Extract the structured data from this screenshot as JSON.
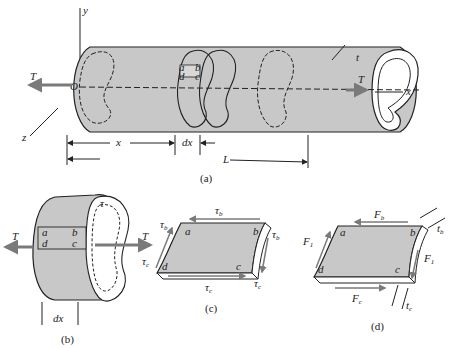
{
  "figure": {
    "panels": [
      {
        "id": "a",
        "caption": "(a)"
      },
      {
        "id": "b",
        "caption": "(b)"
      },
      {
        "id": "c",
        "caption": "(c)"
      },
      {
        "id": "d",
        "caption": "(d)"
      }
    ]
  },
  "panel_a": {
    "axis_y": "y",
    "axis_x": "x",
    "axis_z": "z",
    "origin": "O",
    "torque_left": "T",
    "torque_right": "T",
    "thickness": "t",
    "dim_x": "x",
    "dim_dx": "dx",
    "dim_L": "L",
    "corners": [
      "a",
      "b",
      "c",
      "d"
    ]
  },
  "panel_b": {
    "torque_left": "T",
    "torque_right": "T",
    "shear": "τ",
    "corners": [
      "a",
      "b",
      "c",
      "d"
    ],
    "dim_dx": "dx"
  },
  "panel_c": {
    "tau_b": "τ",
    "tau_b_sub": "b",
    "tau_c": "τ",
    "tau_c_sub": "c",
    "corners": [
      "a",
      "b",
      "c",
      "d"
    ]
  },
  "panel_d": {
    "F_b": "F",
    "F_b_sub": "b",
    "F_c": "F",
    "F_c_sub": "c",
    "F_1": "F",
    "F_1_sub": "1",
    "t_b": "t",
    "t_b_sub": "b",
    "t_c": "t",
    "t_c_sub": "c",
    "corners": [
      "a",
      "b",
      "c",
      "d"
    ]
  },
  "colors": {
    "fill": "#c8c8c8",
    "stroke": "#222222",
    "arrow": "#7a7a7a"
  }
}
